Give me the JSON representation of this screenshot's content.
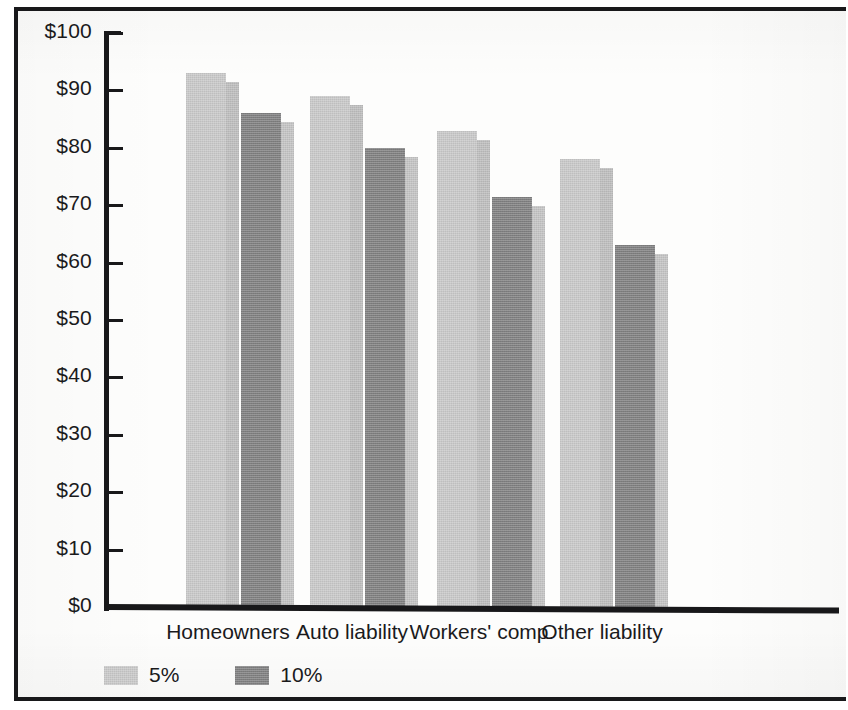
{
  "chart_data": {
    "type": "bar",
    "title": "",
    "subtitle": "",
    "xlabel": "",
    "ylabel": "",
    "categories": [
      "Homeowners",
      "Auto liability",
      "Workers' comp",
      "Other liability"
    ],
    "series": [
      {
        "name": "5%",
        "color": "#c8c8c8",
        "values": [
          93,
          89,
          83,
          78
        ]
      },
      {
        "name": "10%",
        "color": "#7f7f80",
        "values": [
          86,
          80,
          71.5,
          63
        ]
      }
    ],
    "ylim": [
      0,
      100
    ],
    "yticks": [
      0,
      10,
      20,
      30,
      40,
      50,
      60,
      70,
      80,
      90,
      100
    ],
    "ytick_labels": [
      "$0",
      "$10",
      "$20",
      "$30",
      "$40",
      "$50",
      "$60",
      "$70",
      "$80",
      "$90",
      "$100"
    ],
    "grid": false,
    "legend_position": "bottom-left",
    "legend_entries": [
      "5%",
      "10%"
    ],
    "bar_style": "3d-offset",
    "axis_color": "#18181a"
  },
  "legend": {
    "items": [
      {
        "label": "5%",
        "swatch": "light"
      },
      {
        "label": "10%",
        "swatch": "dark"
      }
    ]
  }
}
